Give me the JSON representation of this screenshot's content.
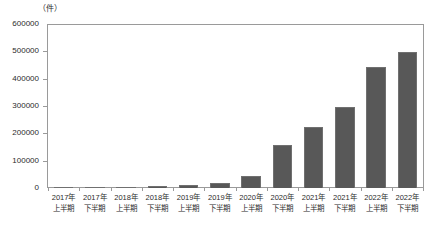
{
  "chart_data": {
    "type": "bar",
    "title": "",
    "subtitle": "",
    "xlabel": "",
    "ylabel": "",
    "unit_label": "（件）",
    "ylim": [
      0,
      600000
    ],
    "ytick_values": [
      600000,
      500000,
      400000,
      300000,
      200000,
      100000,
      0
    ],
    "ytick_labels": [
      "600000",
      "500000",
      "400000",
      "300000",
      "200000",
      "100000",
      "0"
    ],
    "grid": false,
    "legend": null,
    "bar_color": "#585858",
    "bar_edge_color": "#707070",
    "frame_color": "#9a9a9a",
    "categories": [
      "2017年 上半期",
      "2017年 下半期",
      "2018年 上半期",
      "2018年 下半期",
      "2019年 上半期",
      "2019年 下半期",
      "2020年 上半期",
      "2020年 下半期",
      "2021年 上半期",
      "2021年 下半期",
      "2022年 上半期",
      "2022年 下半期"
    ],
    "category_lines": [
      [
        "2017年",
        "上半期"
      ],
      [
        "2017年",
        "下半期"
      ],
      [
        "2018年",
        "上半期"
      ],
      [
        "2018年",
        "下半期"
      ],
      [
        "2019年",
        "上半期"
      ],
      [
        "2019年",
        "下半期"
      ],
      [
        "2020年",
        "上半期"
      ],
      [
        "2020年",
        "下半期"
      ],
      [
        "2021年",
        "上半期"
      ],
      [
        "2021年",
        "下半期"
      ],
      [
        "2022年",
        "上半期"
      ],
      [
        "2022年",
        "下半期"
      ]
    ],
    "values": [
      1000,
      2000,
      5000,
      7000,
      11000,
      18000,
      45000,
      157000,
      223000,
      300000,
      447000,
      502000
    ]
  }
}
